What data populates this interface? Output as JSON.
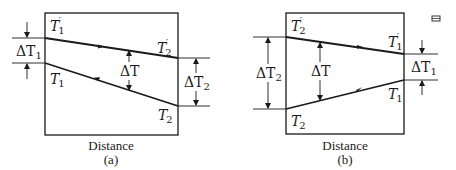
{
  "panels": [
    {
      "id": "a",
      "caption": "(a)",
      "xlabel": "Distance",
      "upper_start": {
        "sym": "T",
        "sub": "1",
        "prime": "′"
      },
      "upper_end": {
        "sym": "T",
        "sub": "2",
        "prime": "′"
      },
      "lower_start": {
        "sym": "T",
        "sub": "1"
      },
      "lower_end": {
        "sym": "T",
        "sub": "2"
      },
      "delta_left": {
        "sym": "ΔT",
        "sub": "1"
      },
      "delta_mid": {
        "sym": "ΔT"
      },
      "delta_right": {
        "sym": "ΔT",
        "sub": "2"
      },
      "flow": "counter-current"
    },
    {
      "id": "b",
      "caption": "(b)",
      "xlabel": "Distance",
      "upper_start": {
        "sym": "T",
        "sub": "2",
        "prime": "′"
      },
      "upper_end": {
        "sym": "T",
        "sub": "1",
        "prime": "′"
      },
      "lower_start": {
        "sym": "T",
        "sub": "2"
      },
      "lower_end": {
        "sym": "T",
        "sub": "1"
      },
      "delta_left": {
        "sym": "ΔT",
        "sub": "2"
      },
      "delta_mid": {
        "sym": "ΔT"
      },
      "delta_right": {
        "sym": "ΔT",
        "sub": "1"
      },
      "flow": "co-current"
    }
  ],
  "colors": {
    "line": "#1a1a1a",
    "background": "#ffffff"
  }
}
